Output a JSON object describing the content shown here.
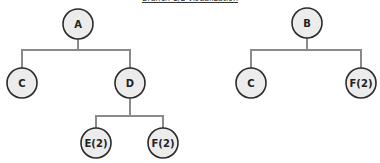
{
  "title": "Branch 1/2 visualization",
  "trees": [
    {
      "root": {
        "label": "A"
      },
      "children": [
        {
          "label": "C"
        },
        {
          "label": "D",
          "children": [
            {
              "label": "E(2)"
            },
            {
              "label": "F(2)"
            }
          ]
        }
      ]
    },
    {
      "root": {
        "label": "B"
      },
      "children": [
        {
          "label": "C"
        },
        {
          "label": "F(2)"
        }
      ]
    }
  ],
  "colors": {
    "node_fill": "#ececec",
    "node_stroke": "#2a2a2a",
    "edge": "#8a8a8a"
  }
}
